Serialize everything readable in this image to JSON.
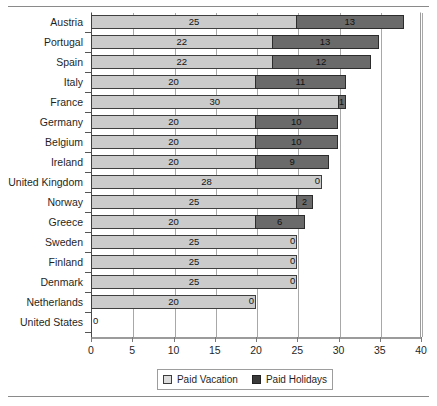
{
  "chart_data": {
    "type": "bar",
    "orientation": "horizontal",
    "stacked": true,
    "title": "",
    "xlabel": "",
    "ylabel": "",
    "xlim": [
      0,
      40
    ],
    "xticks": [
      0,
      5,
      10,
      15,
      20,
      25,
      30,
      35,
      40
    ],
    "xtick_labels": [
      "0",
      "5",
      "10",
      "15",
      "20",
      "25",
      "30",
      "35",
      "40"
    ],
    "grid": true,
    "grid_axis": "x",
    "legend_position": "bottom",
    "categories": [
      "Austria",
      "Portugal",
      "Spain",
      "Italy",
      "France",
      "Germany",
      "Belgium",
      "Ireland",
      "United Kingdom",
      "Norway",
      "Greece",
      "Sweden",
      "Finland",
      "Denmark",
      "Netherlands",
      "United States"
    ],
    "series": [
      {
        "name": "Paid Vacation",
        "color": "#cbcbcb",
        "values": [
          25,
          22,
          22,
          20,
          30,
          20,
          20,
          20,
          28,
          25,
          20,
          25,
          25,
          25,
          20,
          0
        ]
      },
      {
        "name": "Paid Holidays",
        "color": "#6a6a6a",
        "values": [
          13,
          13,
          12,
          11,
          1,
          10,
          10,
          9,
          0,
          2,
          6,
          0,
          0,
          0,
          0,
          0
        ]
      }
    ],
    "totals": [
      38,
      35,
      34,
      31,
      31,
      30,
      30,
      29,
      28,
      27,
      26,
      25,
      25,
      25,
      20,
      0
    ]
  },
  "legend": {
    "items": [
      {
        "label": "Paid Vacation",
        "swatch": "vacation"
      },
      {
        "label": "Paid Holidays",
        "swatch": "holidays"
      }
    ]
  }
}
